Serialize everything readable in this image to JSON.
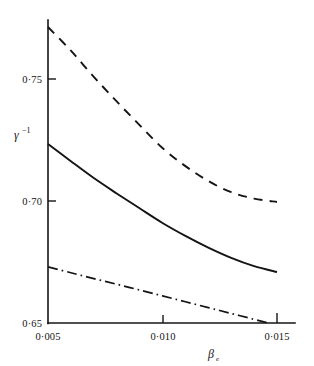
{
  "chart_data": {
    "type": "line",
    "title": "",
    "subtitle": "",
    "xlabel": "β",
    "xlabel_sub": "e",
    "ylabel": "γ",
    "ylabel_sup": "−1",
    "xlim": [
      0.005,
      0.015
    ],
    "ylim": [
      0.65,
      0.7775
    ],
    "xticks": [
      0.005,
      0.01,
      0.015
    ],
    "xtick_labels": [
      "0·005",
      "0·010",
      "0·015"
    ],
    "yticks": [
      0.65,
      0.7,
      0.75
    ],
    "ytick_labels": [
      "0·65",
      "0·70",
      "0·75"
    ],
    "grid": false,
    "legend": "none",
    "x": [
      0.005,
      0.006,
      0.007,
      0.008,
      0.009,
      0.01,
      0.011,
      0.012,
      0.013,
      0.014,
      0.015
    ],
    "series": [
      {
        "name": "upper-curve",
        "style": "dashed",
        "color": "#141414",
        "values": [
          0.7713,
          0.7616,
          0.7509,
          0.7408,
          0.7311,
          0.7217,
          0.7143,
          0.7082,
          0.7036,
          0.701,
          0.6996
        ]
      },
      {
        "name": "middle-curve",
        "style": "solid",
        "color": "#141414",
        "values": [
          0.7234,
          0.7163,
          0.7094,
          0.7031,
          0.697,
          0.691,
          0.6857,
          0.6809,
          0.6767,
          0.6733,
          0.6709
        ]
      },
      {
        "name": "lower-curve",
        "style": "dash-dot",
        "color": "#141414",
        "values": [
          0.673,
          0.6706,
          0.6682,
          0.6659,
          0.6635,
          0.6611,
          0.6587,
          0.6563,
          0.6539,
          0.6515,
          0.6491
        ]
      }
    ]
  },
  "axes": {
    "y_tick_0": "0·75",
    "y_tick_1": "0·70",
    "y_tick_2": "0·65",
    "x_tick_0": "0·005",
    "x_tick_1": "0·010",
    "x_tick_2": "0·015",
    "y_title_base": "γ",
    "y_title_sup": "−1",
    "x_title_base": "β",
    "x_title_sub": "e"
  }
}
